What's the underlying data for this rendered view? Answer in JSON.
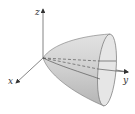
{
  "figure": {
    "axes": {
      "x_label": "x",
      "y_label": "y",
      "z_label": "z"
    },
    "colors": {
      "surface": "#d4d4d4",
      "surface_dark": "#a8a8a8",
      "mouth": "#e4e4e4",
      "outline": "#666666",
      "axis": "#555555"
    }
  }
}
